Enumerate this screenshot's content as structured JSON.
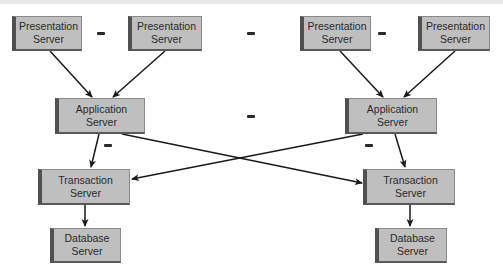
{
  "diagram": {
    "type": "multi-tier server architecture",
    "ellipsis_symbol": "...",
    "colors": {
      "box_fill": "#b9b9b9",
      "box_shadow": "#505050",
      "text": "#2a2a2a",
      "arrow": "#1a1a1a",
      "background": "#ffffff"
    },
    "nodes": [
      {
        "id": "pres1",
        "line1": "Presentation",
        "line2": "Server",
        "tier": "presentation"
      },
      {
        "id": "pres2",
        "line1": "Presentation",
        "line2": "Server",
        "tier": "presentation"
      },
      {
        "id": "pres3",
        "line1": "Presentation",
        "line2": "Server",
        "tier": "presentation"
      },
      {
        "id": "pres4",
        "line1": "Presentation",
        "line2": "Server",
        "tier": "presentation"
      },
      {
        "id": "appL",
        "line1": "Application",
        "line2": "Server",
        "tier": "application"
      },
      {
        "id": "appR",
        "line1": "Application",
        "line2": "Server",
        "tier": "application"
      },
      {
        "id": "transL",
        "line1": "Transaction",
        "line2": "Server",
        "tier": "transaction"
      },
      {
        "id": "transR",
        "line1": "Transaction",
        "line2": "Server",
        "tier": "transaction"
      },
      {
        "id": "dbL",
        "line1": "Database",
        "line2": "Server",
        "tier": "database"
      },
      {
        "id": "dbR",
        "line1": "Database",
        "line2": "Server",
        "tier": "database"
      }
    ],
    "edges": [
      {
        "from": "pres1",
        "to": "appL"
      },
      {
        "from": "pres2",
        "to": "appL"
      },
      {
        "from": "pres3",
        "to": "appR"
      },
      {
        "from": "pres4",
        "to": "appR"
      },
      {
        "from": "appL",
        "to": "transL"
      },
      {
        "from": "appL",
        "to": "transR"
      },
      {
        "from": "appR",
        "to": "transL"
      },
      {
        "from": "appR",
        "to": "transR"
      },
      {
        "from": "transL",
        "to": "dbL"
      },
      {
        "from": "transR",
        "to": "dbR"
      }
    ]
  }
}
